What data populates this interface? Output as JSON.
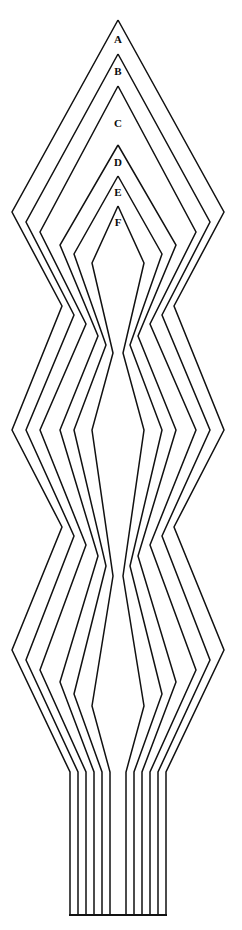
{
  "figure": {
    "canvas": {
      "width": 242,
      "height": 930
    },
    "background_color": "#ffffff",
    "stroke_color": "#111111",
    "stroke_width": 1.5,
    "center_x": 118,
    "baseline_y": 915,
    "vertical_start_y": 772,
    "corner_mark": "",
    "labels": [
      {
        "text": "A",
        "x": 118,
        "y": 40
      },
      {
        "text": "B",
        "x": 118,
        "y": 72
      },
      {
        "text": "C",
        "x": 118,
        "y": 124
      },
      {
        "text": "D",
        "x": 118,
        "y": 163
      },
      {
        "text": "E",
        "x": 118,
        "y": 193
      },
      {
        "text": "F",
        "x": 118,
        "y": 223
      }
    ],
    "contours": [
      {
        "name": "A",
        "apex_y": 20,
        "half_widths": [
          0,
          106,
          56,
          106,
          56,
          106,
          48
        ],
        "node_y": [
          20,
          212,
          306,
          430,
          527,
          650,
          772
        ],
        "vertical_half_width": 48
      },
      {
        "name": "B",
        "apex_y": 54,
        "half_widths": [
          0,
          92,
          44,
          92,
          44,
          92,
          40
        ],
        "node_y": [
          54,
          222,
          315,
          430,
          536,
          660,
          772
        ],
        "vertical_half_width": 40
      },
      {
        "name": "C",
        "apex_y": 86,
        "half_widths": [
          0,
          78,
          32,
          78,
          32,
          78,
          32
        ],
        "node_y": [
          86,
          232,
          324,
          430,
          545,
          670,
          772
        ],
        "vertical_half_width": 32
      },
      {
        "name": "D",
        "apex_y": 145,
        "half_widths": [
          0,
          58,
          20,
          58,
          20,
          58,
          24
        ],
        "node_y": [
          145,
          245,
          336,
          430,
          556,
          682,
          772
        ],
        "vertical_half_width": 24
      },
      {
        "name": "E",
        "apex_y": 176,
        "half_widths": [
          0,
          44,
          12,
          44,
          12,
          44,
          16
        ],
        "node_y": [
          176,
          254,
          345,
          430,
          566,
          694,
          772
        ],
        "vertical_half_width": 16
      },
      {
        "name": "F",
        "apex_y": 206,
        "half_widths": [
          0,
          26,
          5,
          26,
          5,
          26,
          8
        ],
        "node_y": [
          206,
          263,
          353,
          430,
          576,
          706,
          772
        ],
        "vertical_half_width": 8
      }
    ]
  }
}
